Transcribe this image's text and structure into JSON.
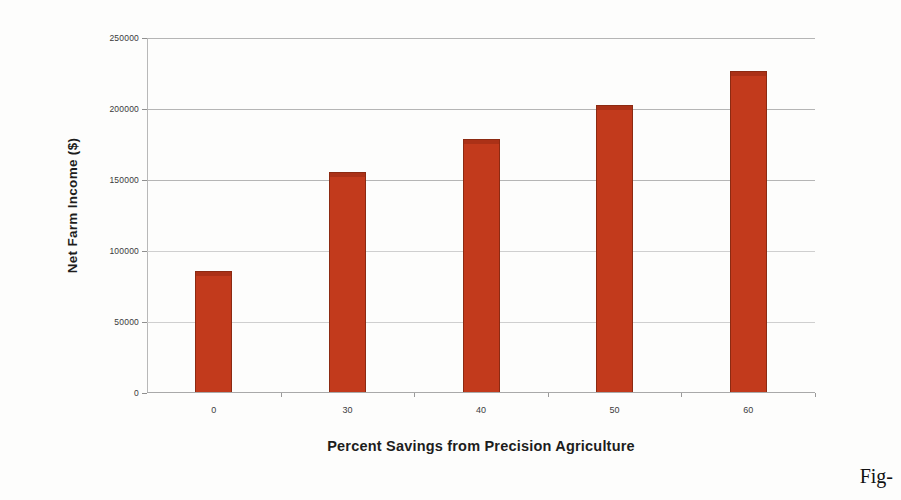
{
  "chart_data": {
    "type": "bar",
    "title": "",
    "xlabel": "Percent Savings from Precision Agriculture",
    "ylabel": "Net Farm Income ($)",
    "categories": [
      "0",
      "30",
      "40",
      "50",
      "60"
    ],
    "values": [
      85000,
      155000,
      178000,
      202000,
      226000
    ],
    "ylim": [
      0,
      250000
    ],
    "ytick_labels": [
      "250000",
      "200000",
      "150000",
      "100000",
      "50000",
      "0"
    ],
    "ytick_values": [
      250000,
      200000,
      150000,
      100000,
      50000,
      0
    ],
    "xtick_labels": [
      "0",
      "30",
      "40",
      "50",
      "60"
    ],
    "grid": true,
    "legend": "none",
    "bar_color": "#c23a1c",
    "bar_edge_color": "#8c2a12"
  },
  "caption": {
    "fragment": "Fig-"
  }
}
